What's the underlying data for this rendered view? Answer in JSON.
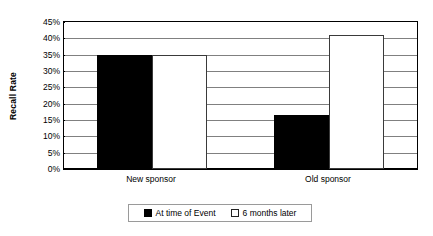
{
  "chart_data": {
    "type": "bar",
    "title": "",
    "xlabel": "",
    "ylabel": "Recall Rate",
    "categories": [
      "New sponsor",
      "Old sponsor"
    ],
    "series": [
      {
        "name": "At time of Event",
        "color": "#000000",
        "values": [
          35,
          16.5
        ]
      },
      {
        "name": "6 months later",
        "color": "#ffffff",
        "values": [
          35,
          41
        ]
      }
    ],
    "ylim": [
      0,
      45
    ],
    "ytick_values": [
      45,
      40,
      35,
      30,
      25,
      20,
      15,
      10,
      5,
      0
    ],
    "ytick_labels": [
      "45%",
      "40%",
      "35%",
      "30%",
      "25%",
      "20%",
      "15%",
      "10%",
      "5%",
      "0%"
    ],
    "grid": "horizontal",
    "legend_position": "bottom",
    "value_format": "percent"
  },
  "axis": {
    "y_title": "Recall Rate"
  },
  "legend": {
    "items": [
      {
        "label": "At time of Event",
        "marker": "filled-square-icon"
      },
      {
        "label": "6 months later",
        "marker": "empty-square-icon"
      }
    ]
  },
  "colors": {
    "series_dark": "#000000",
    "series_light": "#ffffff",
    "gridline": "#808080",
    "frame": "#000000",
    "legend_border": "#9a9a9a"
  }
}
